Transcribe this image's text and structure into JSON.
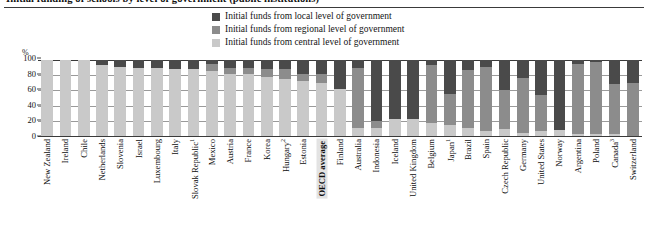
{
  "figure": {
    "cut_title": "Initial funding of schools by level of government (public institutions)",
    "axis_unit": "%"
  },
  "legend": {
    "position": "top-center",
    "items": [
      {
        "label": "Initial funds from local level of government",
        "color": "#4a4a4a",
        "key": "local"
      },
      {
        "label": "Initial funds from regional level of government",
        "color": "#8c8c8c",
        "key": "regional"
      },
      {
        "label": "Initial funds from central level of government",
        "color": "#c9c9c9",
        "key": "central"
      }
    ]
  },
  "chart_data": {
    "type": "bar",
    "stacked": true,
    "orientation": "vertical",
    "title": "Initial funding of schools by level of government (public institutions)",
    "xlabel": "",
    "ylabel": "%",
    "ylim": [
      0,
      100
    ],
    "yticks": [
      0,
      20,
      40,
      60,
      80,
      100
    ],
    "ytick_labels": [
      "0",
      "20",
      "40",
      "60",
      "80",
      "100"
    ],
    "grid": true,
    "legend_position": "top-center",
    "categories": [
      "New Zealand",
      "Ireland",
      "Chile",
      "Netherlands",
      "Slovenia",
      "Israel",
      "Luxembourg",
      "Italy",
      "Slovak Republic",
      "Mexico",
      "Austria",
      "France",
      "Korea",
      "Hungary",
      "Estonia",
      "OECD average",
      "Finland",
      "Australia",
      "Indonesia",
      "Iceland",
      "United Kingdom",
      "Belgium",
      "Japan",
      "Brazil",
      "Spain",
      "Czech Republic",
      "Germany",
      "United States",
      "Norway",
      "Argentina",
      "Poland",
      "Canada",
      "Switzerland"
    ],
    "category_footnotes": {
      "Slovak Republic": "1",
      "Hungary": "2",
      "Japan": "1",
      "Canada": "3"
    },
    "highlighted_category": "OECD average",
    "series": [
      {
        "name": "Initial funds from central level of government",
        "key": "central",
        "color": "#c9c9c9",
        "values": [
          100,
          100,
          100,
          94,
          91,
          90,
          89,
          88,
          88,
          86,
          82,
          81,
          77,
          75,
          72,
          70,
          62,
          10,
          10,
          22,
          22,
          17,
          14,
          10,
          6,
          9,
          4,
          7,
          8,
          3,
          3,
          2,
          0
        ]
      },
      {
        "name": "Initial funds from regional level of government",
        "key": "regional",
        "color": "#8c8c8c",
        "values": [
          0,
          0,
          0,
          0,
          0,
          0,
          0,
          0,
          0,
          9,
          8,
          9,
          11,
          13,
          10,
          12,
          0,
          79,
          10,
          0,
          0,
          76,
          41,
          77,
          85,
          52,
          72,
          47,
          0,
          92,
          94,
          66,
          70
        ]
      },
      {
        "name": "Initial funds from local level of government",
        "key": "local",
        "color": "#4a4a4a",
        "values": [
          0,
          0,
          0,
          6,
          9,
          10,
          11,
          12,
          12,
          5,
          10,
          10,
          12,
          12,
          18,
          18,
          38,
          11,
          80,
          78,
          78,
          7,
          45,
          13,
          9,
          39,
          24,
          46,
          92,
          5,
          3,
          32,
          30
        ]
      }
    ]
  }
}
